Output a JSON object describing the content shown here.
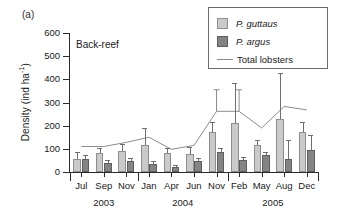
{
  "panel": {
    "label": "(a)",
    "note": "Back-reef"
  },
  "axes": {
    "ylabel_text": "Density (ind ha",
    "ylabel_sup": "-1",
    "ylabel_tail": ")",
    "yticks": [
      "0",
      "100",
      "200",
      "300",
      "400",
      "500",
      "600"
    ],
    "ymin": 0,
    "ymax": 600
  },
  "legend": {
    "items": [
      {
        "label": "P. guttaus",
        "type": "bar",
        "color": "#cacaca",
        "italic": true
      },
      {
        "label": "P. argus",
        "type": "bar",
        "color": "#848484",
        "italic": true
      },
      {
        "label": "Total lobsters",
        "type": "line",
        "color": "#8c8c8c",
        "italic": false
      }
    ]
  },
  "chart_data": {
    "type": "bar",
    "title": "",
    "subtitle": "Back-reef",
    "xlabel": "",
    "ylabel": "Density (ind ha-1)",
    "ylim": [
      0,
      600
    ],
    "grid": false,
    "legend_position": "top-right",
    "categories": [
      "Jul",
      "Sep",
      "Nov",
      "Jan",
      "Apr",
      "Jun",
      "Nov",
      "Feb",
      "May",
      "Aug",
      "Dec"
    ],
    "group_labels": [
      "2003",
      "2004",
      "2005"
    ],
    "group_spans": [
      [
        0,
        2
      ],
      [
        3,
        6
      ],
      [
        7,
        10
      ]
    ],
    "series": [
      {
        "name": "P. guttaus",
        "type": "bar",
        "color": "#cacaca",
        "values": [
          55,
          80,
          92,
          118,
          83,
          77,
          172,
          213,
          118,
          230,
          172
        ],
        "errors_upper": [
          88,
          105,
          122,
          192,
          103,
          108,
          215,
          385,
          140,
          428,
          215
        ]
      },
      {
        "name": "P. argus",
        "type": "bar",
        "color": "#848484",
        "values": [
          58,
          38,
          48,
          35,
          20,
          48,
          88,
          53,
          73,
          57,
          97
        ],
        "errors_upper": [
          72,
          50,
          62,
          48,
          30,
          60,
          103,
          65,
          85,
          140,
          160
        ]
      },
      {
        "name": "Total lobsters",
        "type": "line",
        "color": "#8c8c8c",
        "values": [
          110,
          110,
          128,
          150,
          98,
          115,
          262,
          262,
          190,
          283,
          268
        ],
        "errors_upper": [
          110,
          110,
          128,
          150,
          98,
          115,
          355,
          355,
          190,
          283,
          268
        ]
      }
    ]
  }
}
